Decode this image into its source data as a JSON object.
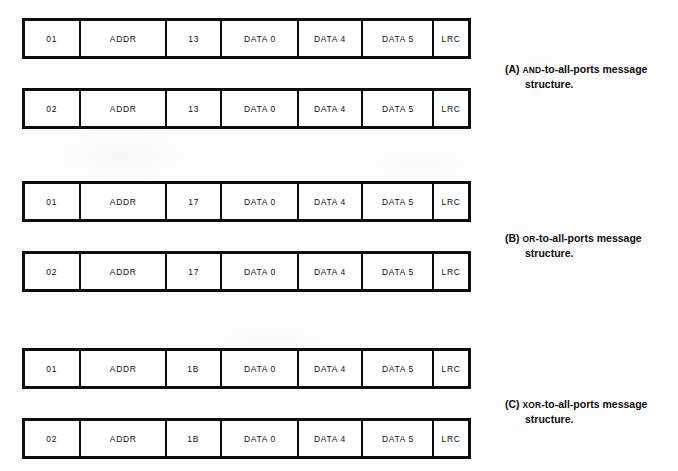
{
  "figure": {
    "bars": [
      {
        "id": "bar-a-01",
        "group": "A",
        "fields": [
          {
            "name": "start-byte",
            "value": "01"
          },
          {
            "name": "address",
            "value": "ADDR"
          },
          {
            "name": "command-code",
            "value": "13"
          },
          {
            "name": "data-0",
            "value": "DATA 0"
          },
          {
            "name": "data-4",
            "value": "DATA 4"
          },
          {
            "name": "data-5",
            "value": "DATA 5"
          },
          {
            "name": "lrc",
            "value": "LRC"
          }
        ]
      },
      {
        "id": "bar-a-02",
        "group": "A",
        "fields": [
          {
            "name": "start-byte",
            "value": "02"
          },
          {
            "name": "address",
            "value": "ADDR"
          },
          {
            "name": "command-code",
            "value": "13"
          },
          {
            "name": "data-0",
            "value": "DATA 0"
          },
          {
            "name": "data-4",
            "value": "DATA 4"
          },
          {
            "name": "data-5",
            "value": "DATA 5"
          },
          {
            "name": "lrc",
            "value": "LRC"
          }
        ]
      },
      {
        "id": "bar-b-01",
        "group": "B",
        "fields": [
          {
            "name": "start-byte",
            "value": "01"
          },
          {
            "name": "address",
            "value": "ADDR"
          },
          {
            "name": "command-code",
            "value": "17"
          },
          {
            "name": "data-0",
            "value": "DATA 0"
          },
          {
            "name": "data-4",
            "value": "DATA 4"
          },
          {
            "name": "data-5",
            "value": "DATA 5"
          },
          {
            "name": "lrc",
            "value": "LRC"
          }
        ]
      },
      {
        "id": "bar-b-02",
        "group": "B",
        "fields": [
          {
            "name": "start-byte",
            "value": "02"
          },
          {
            "name": "address",
            "value": "ADDR"
          },
          {
            "name": "command-code",
            "value": "17"
          },
          {
            "name": "data-0",
            "value": "DATA 0"
          },
          {
            "name": "data-4",
            "value": "DATA 4"
          },
          {
            "name": "data-5",
            "value": "DATA 5"
          },
          {
            "name": "lrc",
            "value": "LRC"
          }
        ]
      },
      {
        "id": "bar-c-01",
        "group": "C",
        "fields": [
          {
            "name": "start-byte",
            "value": "01"
          },
          {
            "name": "address",
            "value": "ADDR"
          },
          {
            "name": "command-code",
            "value": "1B"
          },
          {
            "name": "data-0",
            "value": "DATA 0"
          },
          {
            "name": "data-4",
            "value": "DATA 4"
          },
          {
            "name": "data-5",
            "value": "DATA 5"
          },
          {
            "name": "lrc",
            "value": "LRC"
          }
        ]
      },
      {
        "id": "bar-c-02",
        "group": "C",
        "fields": [
          {
            "name": "start-byte",
            "value": "02"
          },
          {
            "name": "address",
            "value": "ADDR"
          },
          {
            "name": "command-code",
            "value": "1B"
          },
          {
            "name": "data-0",
            "value": "DATA 0"
          },
          {
            "name": "data-4",
            "value": "DATA 4"
          },
          {
            "name": "data-5",
            "value": "DATA 5"
          },
          {
            "name": "lrc",
            "value": "LRC"
          }
        ]
      }
    ],
    "captions": [
      {
        "id": "caption-a",
        "label": "(A)",
        "operator": "AND",
        "rest": "-to-all-ports message",
        "line2": "structure."
      },
      {
        "id": "caption-b",
        "label": "(B)",
        "operator": "OR",
        "rest": "-to-all-ports message",
        "line2": "structure."
      },
      {
        "id": "caption-c",
        "label": "(C)",
        "operator": "XOR",
        "rest": "-to-all-ports message",
        "line2": "structure."
      }
    ],
    "colors": {
      "ink": "#0d0d0d",
      "paper": "#fdfdfd",
      "cell_fill": "#ffffff"
    }
  }
}
